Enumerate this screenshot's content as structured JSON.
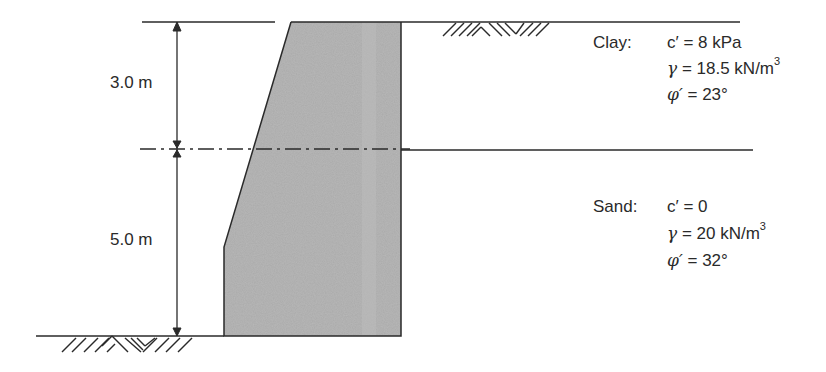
{
  "dimensions": {
    "upper": "3.0 m",
    "lower": "5.0 m"
  },
  "layers": [
    {
      "name": "Clay:",
      "props": [
        {
          "symbol": "c′",
          "eq": " = 8 kPa",
          "sup": ""
        },
        {
          "symbol": "γ",
          "eq": " = 18.5 kN/m",
          "sup": "3"
        },
        {
          "symbol": "φ′",
          "eq": " = 23°",
          "sup": ""
        }
      ]
    },
    {
      "name": "Sand:",
      "props": [
        {
          "symbol": "c′",
          "eq": " = 0",
          "sup": ""
        },
        {
          "symbol": "γ",
          "eq": " = 20 kN/m",
          "sup": "3"
        },
        {
          "symbol": "φ′",
          "eq": " = 32°",
          "sup": ""
        }
      ]
    }
  ],
  "colors": {
    "wall_fill": "#a9a9a9",
    "line": "#2a2a2a"
  }
}
